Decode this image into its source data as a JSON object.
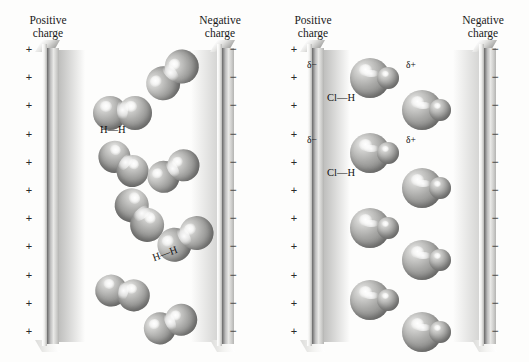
{
  "figure": {
    "panels": [
      {
        "id": "nonpolar",
        "molecule_label": "H—H",
        "positive_header": "Positive\ncharge",
        "negative_header": "Negative\ncharge",
        "positive_symbol": "+",
        "negative_symbol": "−",
        "charge_count": 11
      },
      {
        "id": "polar",
        "molecule_label": "Cl—H",
        "positive_header": "Positive\ncharge",
        "negative_header": "Negative\ncharge",
        "positive_symbol": "+",
        "negative_symbol": "−",
        "charge_count": 11,
        "partial_negative": "δ−",
        "partial_positive": "δ+"
      }
    ],
    "headers": {
      "positive_line1": "Positive",
      "positive_line2": "charge",
      "negative_line1": "Negative",
      "negative_line2": "charge"
    },
    "labels": {
      "hh": "H—H",
      "clh": "Cl—H",
      "delta_minus": "δ−",
      "delta_plus": "δ+"
    },
    "colors": {
      "background": "#fdfdfc",
      "atom_mid": "#9a9a98",
      "atom_dark": "#767674",
      "atom_light": "#f2f2f1",
      "text": "#111111"
    },
    "nonpolar_molecules": [
      {
        "x": 143,
        "y": 58,
        "rot": -42,
        "r": 17
      },
      {
        "x": 93,
        "y": 96,
        "rot": 0,
        "r": 17
      },
      {
        "x": 96,
        "y": 148,
        "rot": 38,
        "r": 16
      },
      {
        "x": 146,
        "y": 155,
        "rot": -30,
        "r": 16
      },
      {
        "x": 110,
        "y": 198,
        "rot": 52,
        "r": 17
      },
      {
        "x": 156,
        "y": 222,
        "rot": -28,
        "r": 17
      },
      {
        "x": 95,
        "y": 277,
        "rot": 12,
        "r": 16
      },
      {
        "x": 143,
        "y": 308,
        "rot": -22,
        "r": 16
      }
    ],
    "polar_molecules": [
      {
        "x": 350,
        "y": 58
      },
      {
        "x": 402,
        "y": 90
      },
      {
        "x": 350,
        "y": 133
      },
      {
        "x": 402,
        "y": 168
      },
      {
        "x": 350,
        "y": 208
      },
      {
        "x": 402,
        "y": 240
      },
      {
        "x": 350,
        "y": 280
      },
      {
        "x": 402,
        "y": 312
      }
    ]
  }
}
